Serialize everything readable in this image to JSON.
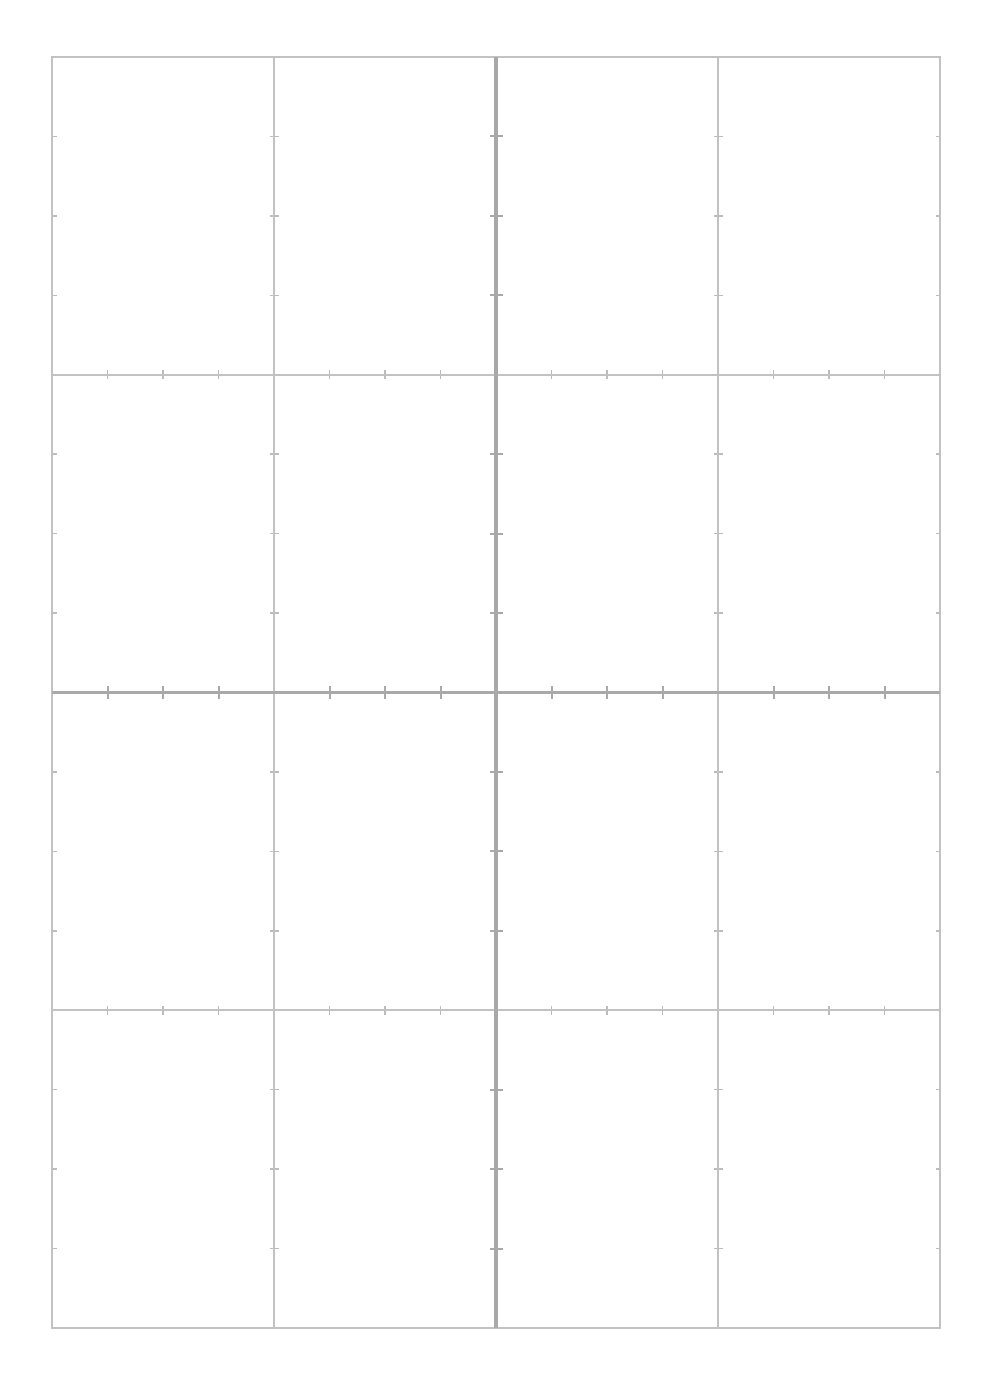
{
  "page": {
    "background_color": "#ffffff",
    "width": 991,
    "height": 1393
  },
  "grid": {
    "name": "blank-cartesian-graph-grid",
    "frame": {
      "left": 52,
      "top": 57,
      "right": 940,
      "bottom": 1328,
      "width": 888,
      "height": 1271,
      "color": "#c2c2c2",
      "stroke_width": 1.6
    },
    "major": {
      "color": "#c2c2c2",
      "stroke_width": 1.6,
      "vertical_x": [
        52,
        274,
        496,
        718,
        940
      ],
      "horizontal_y": [
        57,
        374.75,
        692.5,
        1010.25,
        1328
      ],
      "columns": 4,
      "rows": 4,
      "cell_width": 222,
      "cell_height": 317.75
    },
    "axes": {
      "color": "#a9a9a9",
      "stroke_width": 3.4,
      "origin_x": 496,
      "origin_y": 692.5,
      "x_axis_label": "",
      "y_axis_label": ""
    },
    "ticks": {
      "color": "#bcbcbc",
      "stroke_width": 1.6,
      "subdivisions_per_cell": 4,
      "spacing_x": 55.5,
      "spacing_y": 79.4375,
      "length_minor": 9,
      "length_major": 13
    },
    "labels": {
      "tick_labels_x": [],
      "tick_labels_y": [],
      "show_numbers": false
    }
  },
  "chart_data": {
    "type": "line",
    "title": "",
    "subtitle": "",
    "xlabel": "",
    "ylabel": "",
    "series": [],
    "x": [],
    "categories": [],
    "values": [],
    "annotations": [],
    "legend": [],
    "legend_position": "none",
    "grid": true,
    "xlim": [
      -2,
      2
    ],
    "ylim": [
      -2,
      2
    ],
    "xticks": [
      -2,
      -1,
      0,
      1,
      2
    ],
    "yticks": [
      -2,
      -1,
      0,
      1,
      2
    ],
    "minor_ticks_per_interval": 4,
    "note": "Empty graph paper: blank 4x4 major-cell coordinate grid with a central darker x/y axis cross and minor tick marks; no plotted data, no axis numbers."
  }
}
